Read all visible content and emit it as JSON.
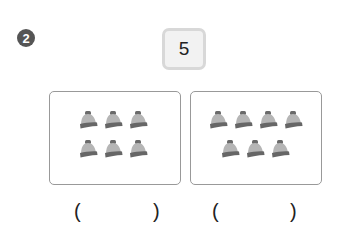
{
  "question": {
    "number": "2"
  },
  "target_number": "5",
  "panels": [
    {
      "rows": [
        3,
        3
      ],
      "icon": "knit-hat-icon",
      "count": 6
    },
    {
      "rows": [
        4,
        3
      ],
      "icon": "knit-hat-icon",
      "count": 7
    }
  ],
  "answers": {
    "open": "(",
    "close": ")",
    "left_value": "",
    "right_value": ""
  },
  "colors": {
    "hat_body": "#b5b5b5",
    "hat_band": "#666666",
    "hat_pom": "#6a6a6a",
    "badge": "#555555"
  }
}
